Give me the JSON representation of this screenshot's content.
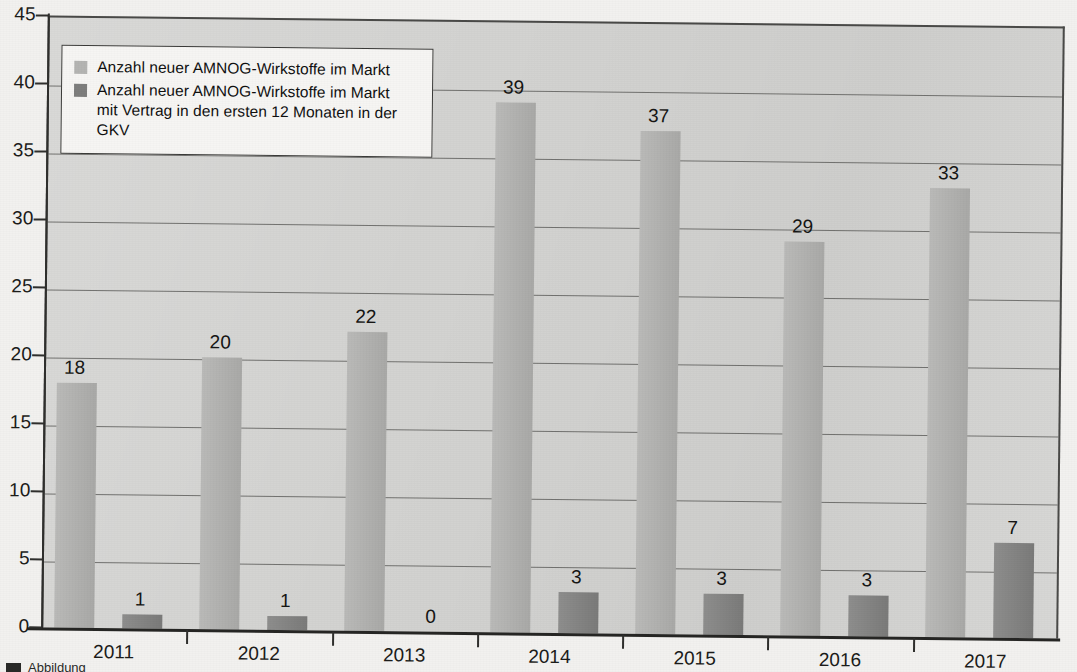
{
  "chart_data": {
    "type": "bar",
    "title": "",
    "subtitle": "",
    "xlabel": "",
    "ylabel": "",
    "categories": [
      "2011",
      "2012",
      "2013",
      "2014",
      "2015",
      "2016",
      "2017"
    ],
    "series": [
      {
        "name": "Anzahl neuer AMNOG-Wirkstoffe im Markt",
        "color": "#b2b2b0",
        "values": [
          18,
          20,
          22,
          39,
          37,
          29,
          33
        ]
      },
      {
        "name": "Anzahl neuer AMNOG-Wirkstoffe im Markt mit Vertrag in den ersten 12 Monaten in der GKV",
        "color": "#818180",
        "values": [
          1,
          1,
          0,
          3,
          3,
          3,
          7
        ]
      }
    ],
    "ylim": [
      0,
      45
    ],
    "ytick_values": [
      0,
      5,
      10,
      15,
      20,
      25,
      30,
      35,
      40,
      45
    ],
    "ytick_labels": [
      "0",
      "5",
      "10",
      "15",
      "20",
      "25",
      "30",
      "35",
      "40",
      "45"
    ],
    "grid": true,
    "legend_position": "top-left",
    "plot_background": "#d3d3d1"
  },
  "legend": {
    "entries": [
      {
        "swatch": "light",
        "line1": "Anzahl neuer AMNOG-Wirkstoffe im Markt",
        "line2": ""
      },
      {
        "swatch": "dark",
        "line1": "Anzahl neuer AMNOG-Wirkstoffe im Markt",
        "line2": "mit Vertrag in den ersten 12 Monaten in der GKV"
      }
    ]
  },
  "caption": {
    "text": "Abbildung"
  },
  "colors": {
    "series_light": "#b2b2b0",
    "series_dark": "#818180",
    "plot_bg": "#d3d3d1",
    "page_bg": "#f2f1ef",
    "axis": "#2f2f2d",
    "gridline": "#5d5d5a",
    "text": "#161614"
  }
}
